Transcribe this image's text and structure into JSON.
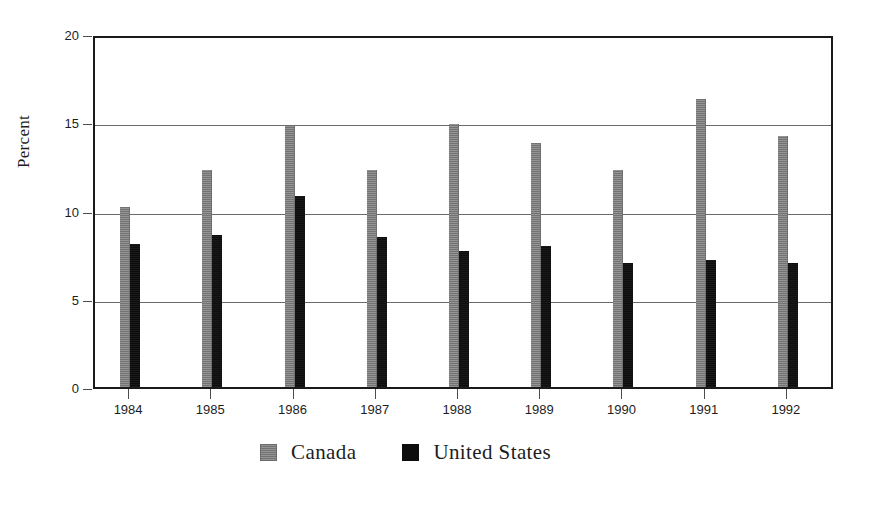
{
  "chart_data": {
    "type": "bar",
    "title": "",
    "subtitle": "",
    "xlabel": "",
    "ylabel": "Percent",
    "categories": [
      "1984",
      "1985",
      "1986",
      "1987",
      "1988",
      "1989",
      "1990",
      "1991",
      "1992"
    ],
    "series": [
      {
        "name": "Canada",
        "color": "#808080",
        "values": [
          10.2,
          12.3,
          14.8,
          12.3,
          14.9,
          13.8,
          12.3,
          16.3,
          14.2
        ]
      },
      {
        "name": "United States",
        "color": "#0d0d0d",
        "values": [
          8.1,
          8.6,
          10.8,
          8.5,
          7.7,
          8.0,
          7.0,
          7.2,
          7.0
        ]
      }
    ],
    "ylim": [
      0,
      20
    ],
    "yticks": [
      0,
      5,
      10,
      15,
      20
    ],
    "ytick_labels": [
      "0",
      "5",
      "10",
      "15",
      "20"
    ],
    "grid": "horizontal",
    "legend_position": "bottom-center"
  },
  "legend": {
    "entries": [
      {
        "label": "Canada",
        "swatch": "gray-swatch-icon"
      },
      {
        "label": "United States",
        "swatch": "black-swatch-icon"
      }
    ]
  }
}
